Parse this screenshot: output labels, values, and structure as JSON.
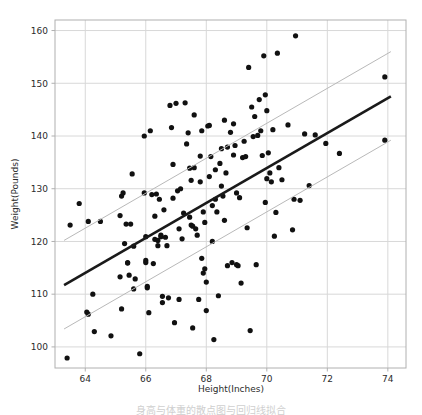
{
  "figure": {
    "background_color": "#ffffff",
    "frame_color": "#b0b0b0",
    "grid_color": "#d8d8d8",
    "caption": "身高与体重的散点图与回归线拟合"
  },
  "chart_data": {
    "type": "scatter",
    "title": "",
    "xlabel": "Height(Inches)",
    "ylabel": "Weight(Pounds)",
    "xlim": [
      63.0,
      74.6
    ],
    "ylim": [
      96.0,
      162.0
    ],
    "xticks": [
      64,
      66,
      68,
      70,
      72,
      74
    ],
    "yticks": [
      100,
      110,
      120,
      130,
      140,
      150,
      160
    ],
    "xtick_labels": [
      "64",
      "66",
      "68",
      "70",
      "72",
      "74"
    ],
    "ytick_labels": [
      "100",
      "110",
      "120",
      "130",
      "140",
      "150",
      "160"
    ],
    "grid": true,
    "legend": false,
    "marker": {
      "shape": "circle",
      "color": "#111111",
      "size_px": 2.6
    },
    "series": [
      {
        "name": "observations",
        "type": "scatter",
        "color": "#111111",
        "points": [
          [
            63.4,
            97.9
          ],
          [
            63.5,
            123.1
          ],
          [
            63.8,
            127.2
          ],
          [
            64.05,
            106.6
          ],
          [
            64.1,
            106.2
          ],
          [
            64.1,
            123.8
          ],
          [
            64.25,
            110.0
          ],
          [
            64.3,
            102.9
          ],
          [
            64.5,
            123.8
          ],
          [
            64.85,
            102.1
          ],
          [
            65.15,
            124.9
          ],
          [
            65.15,
            113.3
          ],
          [
            65.2,
            107.2
          ],
          [
            65.2,
            128.6
          ],
          [
            65.25,
            129.2
          ],
          [
            65.3,
            119.6
          ],
          [
            65.35,
            123.3
          ],
          [
            65.4,
            116.0
          ],
          [
            65.4,
            115.9
          ],
          [
            65.45,
            113.6
          ],
          [
            65.5,
            123.3
          ],
          [
            65.55,
            132.8
          ],
          [
            65.6,
            111.0
          ],
          [
            65.6,
            119.1
          ],
          [
            65.65,
            112.9
          ],
          [
            65.8,
            98.7
          ],
          [
            65.95,
            140.0
          ],
          [
            65.95,
            129.2
          ],
          [
            66.0,
            120.9
          ],
          [
            66.0,
            116.4
          ],
          [
            66.0,
            116.0
          ],
          [
            66.05,
            111.2
          ],
          [
            66.05,
            111.5
          ],
          [
            66.1,
            106.5
          ],
          [
            66.15,
            141.0
          ],
          [
            66.2,
            128.9
          ],
          [
            66.25,
            115.8
          ],
          [
            66.3,
            124.8
          ],
          [
            66.3,
            120.4
          ],
          [
            66.35,
            129.0
          ],
          [
            66.4,
            120.2
          ],
          [
            66.4,
            119.2
          ],
          [
            66.45,
            128.0
          ],
          [
            66.5,
            121.2
          ],
          [
            66.5,
            120.9
          ],
          [
            66.55,
            109.6
          ],
          [
            66.55,
            108.4
          ],
          [
            66.6,
            126.0
          ],
          [
            66.65,
            120.8
          ],
          [
            66.7,
            119.2
          ],
          [
            66.75,
            109.3
          ],
          [
            66.8,
            145.8
          ],
          [
            66.85,
            141.6
          ],
          [
            66.9,
            134.6
          ],
          [
            66.9,
            128.2
          ],
          [
            66.95,
            104.6
          ],
          [
            67.0,
            146.2
          ],
          [
            67.05,
            129.6
          ],
          [
            67.1,
            122.4
          ],
          [
            67.1,
            109.0
          ],
          [
            67.15,
            130.0
          ],
          [
            67.2,
            120.5
          ],
          [
            67.25,
            125.4
          ],
          [
            67.3,
            146.3
          ],
          [
            67.35,
            138.5
          ],
          [
            67.4,
            140.6
          ],
          [
            67.45,
            133.9
          ],
          [
            67.45,
            124.6
          ],
          [
            67.5,
            131.6
          ],
          [
            67.5,
            123.1
          ],
          [
            67.55,
            122.9
          ],
          [
            67.55,
            103.6
          ],
          [
            67.6,
            144.0
          ],
          [
            67.6,
            134.0
          ],
          [
            67.65,
            122.4
          ],
          [
            67.7,
            121.2
          ],
          [
            67.75,
            109.0
          ],
          [
            67.8,
            136.2
          ],
          [
            67.8,
            131.3
          ],
          [
            67.85,
            141.0
          ],
          [
            67.85,
            116.8
          ],
          [
            67.9,
            125.6
          ],
          [
            67.9,
            114.0
          ],
          [
            67.95,
            123.6
          ],
          [
            67.95,
            114.8
          ],
          [
            68.0,
            112.3
          ],
          [
            68.0,
            106.9
          ],
          [
            68.05,
            141.9
          ],
          [
            68.1,
            142.0
          ],
          [
            68.1,
            132.3
          ],
          [
            68.15,
            136.1
          ],
          [
            68.2,
            126.8
          ],
          [
            68.2,
            120.0
          ],
          [
            68.25,
            101.4
          ],
          [
            68.3,
            133.6
          ],
          [
            68.3,
            128.0
          ],
          [
            68.35,
            125.6
          ],
          [
            68.4,
            109.7
          ],
          [
            68.45,
            134.8
          ],
          [
            68.5,
            137.6
          ],
          [
            68.5,
            130.5
          ],
          [
            68.55,
            128.6
          ],
          [
            68.6,
            143.0
          ],
          [
            68.6,
            124.0
          ],
          [
            68.65,
            133.0
          ],
          [
            68.7,
            137.9
          ],
          [
            68.7,
            115.4
          ],
          [
            68.8,
            140.7
          ],
          [
            68.85,
            116.0
          ],
          [
            68.9,
            142.3
          ],
          [
            68.9,
            136.4
          ],
          [
            68.95,
            138.2
          ],
          [
            69.0,
            129.2
          ],
          [
            69.0,
            115.6
          ],
          [
            69.05,
            115.4
          ],
          [
            69.1,
            128.3
          ],
          [
            69.15,
            112.1
          ],
          [
            69.2,
            135.9
          ],
          [
            69.25,
            139.0
          ],
          [
            69.3,
            136.1
          ],
          [
            69.35,
            122.6
          ],
          [
            69.4,
            153.0
          ],
          [
            69.45,
            103.1
          ],
          [
            69.5,
            145.5
          ],
          [
            69.55,
            139.9
          ],
          [
            69.6,
            143.7
          ],
          [
            69.65,
            115.6
          ],
          [
            69.7,
            140.1
          ],
          [
            69.75,
            146.9
          ],
          [
            69.8,
            141.0
          ],
          [
            69.85,
            136.3
          ],
          [
            69.9,
            155.2
          ],
          [
            69.95,
            147.8
          ],
          [
            69.95,
            127.4
          ],
          [
            70.0,
            131.9
          ],
          [
            70.0,
            144.8
          ],
          [
            70.05,
            136.8
          ],
          [
            70.1,
            133.0
          ],
          [
            70.15,
            131.3
          ],
          [
            70.2,
            141.2
          ],
          [
            70.25,
            121.0
          ],
          [
            70.3,
            125.5
          ],
          [
            70.35,
            155.7
          ],
          [
            70.4,
            134.0
          ],
          [
            70.5,
            131.7
          ],
          [
            70.7,
            142.1
          ],
          [
            70.85,
            122.2
          ],
          [
            70.9,
            128.0
          ],
          [
            70.95,
            159.0
          ],
          [
            71.1,
            127.8
          ],
          [
            71.25,
            140.4
          ],
          [
            71.4,
            130.6
          ],
          [
            71.6,
            140.2
          ],
          [
            71.95,
            138.6
          ],
          [
            72.4,
            136.7
          ],
          [
            73.9,
            151.2
          ],
          [
            73.9,
            139.2
          ]
        ]
      },
      {
        "name": "regression-line",
        "type": "line",
        "color": "#1a1a1a",
        "width_px": 2.6,
        "endpoints": [
          [
            63.3,
            111.7
          ],
          [
            74.1,
            147.5
          ]
        ]
      },
      {
        "name": "upper-band-line",
        "type": "line",
        "color": "#b9b9b9",
        "width_px": 1.0,
        "endpoints": [
          [
            63.3,
            120.2
          ],
          [
            74.1,
            156.0
          ]
        ]
      },
      {
        "name": "lower-band-line",
        "type": "line",
        "color": "#b9b9b9",
        "width_px": 1.0,
        "endpoints": [
          [
            63.3,
            103.4
          ],
          [
            74.1,
            139.2
          ]
        ]
      }
    ]
  }
}
